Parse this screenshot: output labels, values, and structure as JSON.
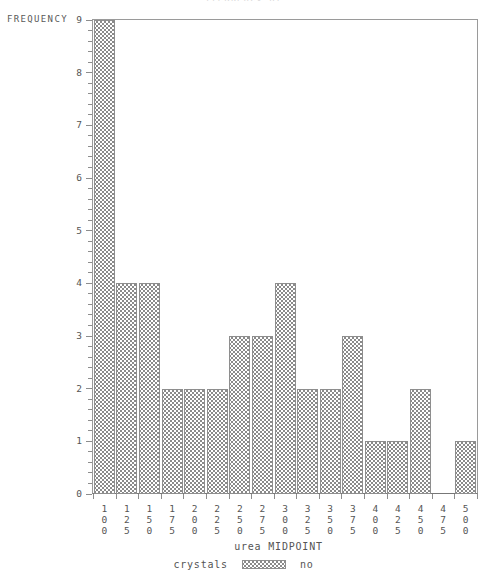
{
  "chart_data": {
    "type": "bar",
    "title": "frequency of",
    "xlabel": "urea MIDPOINT",
    "ylabel": "FREQUENCY",
    "categories": [
      "100",
      "125",
      "150",
      "175",
      "200",
      "225",
      "250",
      "275",
      "300",
      "325",
      "350",
      "375",
      "400",
      "425",
      "450",
      "475",
      "500"
    ],
    "values": [
      9,
      4,
      4,
      2,
      2,
      2,
      3,
      3,
      4,
      2,
      2,
      3,
      1,
      1,
      2,
      0,
      1
    ],
    "ylim": [
      0,
      9
    ],
    "yticks": [
      "0",
      "1",
      "2",
      "3",
      "4",
      "5",
      "6",
      "7",
      "8",
      "9"
    ],
    "grid": false,
    "legend": {
      "position": "bottom",
      "title": "crystals",
      "entries": [
        {
          "label": "no",
          "pattern": "cross-hatch"
        }
      ]
    },
    "colors": {
      "bar_fill": "#ffffff",
      "bar_hatch": "#8a8a8a",
      "bar_border": "#8e8e8e",
      "axis": "#8d8d8d",
      "text": "#555555"
    }
  },
  "axes": {
    "y_title": "FREQUENCY",
    "x_title": "urea MIDPOINT"
  },
  "legend": {
    "title": "crystals",
    "value": "no"
  }
}
